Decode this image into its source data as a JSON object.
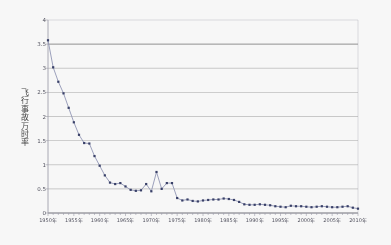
{
  "chart_data": {
    "type": "line",
    "title": "",
    "subtitle": "",
    "xlabel": "",
    "ylabel": "飞行事故万时率",
    "series_name": "飞行事故万时率",
    "xlim": [
      1950,
      2010
    ],
    "ylim": [
      0,
      4
    ],
    "ytick_step": 0.5,
    "grid": "horizontal",
    "legend": "none",
    "marker": "square",
    "marker_color": "#2d3561",
    "line_color": "#8f94b5",
    "gridline_color": "#7a7a7a",
    "axis_color": "#9a9aa8",
    "background": "#ffffff",
    "y_ticks": [
      "0",
      "0.5",
      "1",
      "1.5",
      "2",
      "2.5",
      "3",
      "3.5",
      "4"
    ],
    "y_tick_values": [
      0,
      0.5,
      1,
      1.5,
      2,
      2.5,
      3,
      3.5,
      4
    ],
    "x_ticks": [
      "1950年",
      "1955年",
      "1960年",
      "1965年",
      "1970年",
      "1975年",
      "1980年",
      "1985年",
      "1990年",
      "1995年",
      "2000年",
      "2005年",
      "2010年"
    ],
    "x_tick_values": [
      1950,
      1955,
      1960,
      1965,
      1970,
      1975,
      1980,
      1985,
      1990,
      1995,
      2000,
      2005,
      2010
    ],
    "x": [
      1950,
      1951,
      1952,
      1953,
      1954,
      1955,
      1956,
      1957,
      1958,
      1959,
      1960,
      1961,
      1962,
      1963,
      1964,
      1965,
      1966,
      1967,
      1968,
      1969,
      1970,
      1971,
      1972,
      1973,
      1974,
      1975,
      1976,
      1977,
      1978,
      1979,
      1980,
      1981,
      1982,
      1983,
      1984,
      1985,
      1986,
      1987,
      1988,
      1989,
      1990,
      1991,
      1992,
      1993,
      1994,
      1995,
      1996,
      1997,
      1998,
      1999,
      2000,
      2001,
      2002,
      2003,
      2004,
      2005,
      2006,
      2007,
      2008,
      2009,
      2010
    ],
    "values": [
      3.58,
      3.02,
      2.72,
      2.48,
      2.18,
      1.88,
      1.62,
      1.45,
      1.44,
      1.18,
      0.98,
      0.78,
      0.63,
      0.6,
      0.62,
      0.55,
      0.48,
      0.46,
      0.47,
      0.6,
      0.45,
      0.85,
      0.5,
      0.62,
      0.62,
      0.31,
      0.26,
      0.28,
      0.25,
      0.24,
      0.26,
      0.27,
      0.28,
      0.28,
      0.3,
      0.29,
      0.27,
      0.23,
      0.18,
      0.17,
      0.17,
      0.18,
      0.17,
      0.16,
      0.14,
      0.13,
      0.12,
      0.15,
      0.14,
      0.14,
      0.13,
      0.12,
      0.13,
      0.14,
      0.13,
      0.12,
      0.12,
      0.13,
      0.14,
      0.11,
      0.09
    ],
    "plot_area": {
      "left": 48,
      "top": 20,
      "right": 358,
      "bottom": 213
    }
  }
}
